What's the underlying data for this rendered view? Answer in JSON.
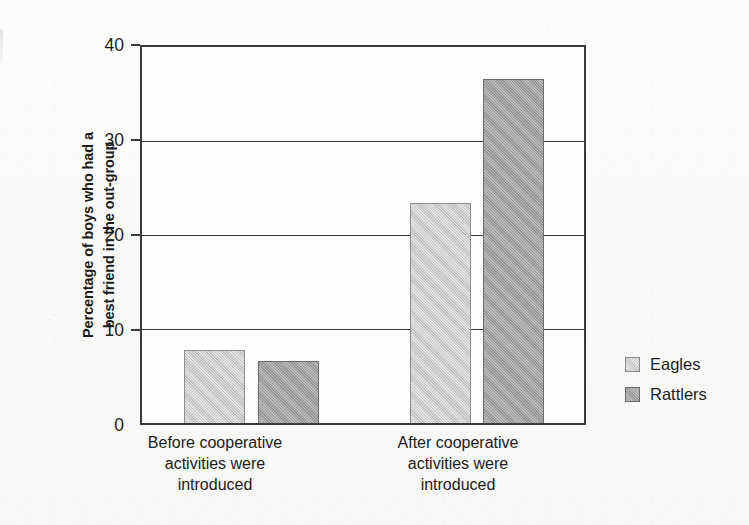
{
  "chart_data": {
    "type": "bar",
    "title": "",
    "subtitle": "",
    "xlabel": "",
    "ylabel": "Percentage of boys who had a best friend in the out-group",
    "ylabel_lines": [
      "Percentage of boys who had a",
      "best friend in the out-group"
    ],
    "categories": [
      "Before cooperative activities were introduced",
      "After cooperative activities were introduced"
    ],
    "category_label_lines": [
      [
        "Before cooperative",
        "activities were",
        "introduced"
      ],
      [
        "After cooperative",
        "activities were",
        "introduced"
      ]
    ],
    "series": [
      {
        "name": "Eagles",
        "values": [
          7.8,
          23.4
        ],
        "color": "#c6c6c6"
      },
      {
        "name": "Rattlers",
        "values": [
          6.6,
          36.6
        ],
        "color": "#9a9a9a"
      }
    ],
    "ylim": [
      0,
      40
    ],
    "ytick_values": [
      0,
      10,
      20,
      30,
      40
    ],
    "ytick_labels": [
      "0",
      "10",
      "20",
      "30",
      "40"
    ],
    "grid": true,
    "grid_axis": "y",
    "legend_position": "right",
    "legend_entries": [
      "Eagles",
      "Rattlers"
    ]
  },
  "axis": {
    "tick_0": "0",
    "tick_10": "10",
    "tick_20": "20",
    "tick_30": "30",
    "tick_40": "40"
  },
  "y_title": {
    "line1": "Percentage of boys who had a",
    "line2": "best friend in the out-group"
  },
  "categories": {
    "group1": {
      "line1": "Before cooperative",
      "line2": "activities were",
      "line3": "introduced"
    },
    "group2": {
      "line1": "After cooperative",
      "line2": "activities were",
      "line3": "introduced"
    }
  },
  "legend": {
    "eagles": "Eagles",
    "rattlers": "Rattlers"
  }
}
